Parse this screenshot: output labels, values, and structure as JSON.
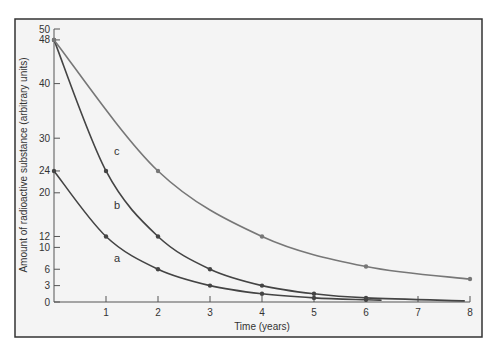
{
  "chart_data": {
    "type": "line",
    "title": "",
    "xlabel": "Time (years)",
    "ylabel": "Amount of radioactive substance (arbitrary units)",
    "xlim": [
      0,
      8
    ],
    "ylim": [
      0,
      50
    ],
    "x_ticks": [
      "1",
      "2",
      "3",
      "4",
      "5",
      "6",
      "7",
      "8"
    ],
    "y_ticks": [
      "0",
      "3",
      "6",
      "10",
      "12",
      "20",
      "24",
      "30",
      "40",
      "48",
      "50"
    ],
    "grid": false,
    "legend": "inline curve labels",
    "series": [
      {
        "name": "a",
        "label_pos": [
          2.0,
          8.5
        ],
        "x": [
          0,
          1,
          2,
          3,
          4,
          5,
          6
        ],
        "values": [
          24,
          12,
          6,
          3,
          1.5,
          0.75,
          0.4
        ],
        "curve_end_x": 6.3,
        "color": "#444444"
      },
      {
        "name": "b",
        "label_pos": [
          2.0,
          18.5
        ],
        "x": [
          0,
          1,
          2,
          3,
          4,
          5,
          6
        ],
        "values": [
          48,
          24,
          12,
          6,
          3,
          1.5,
          0.75
        ],
        "curve_end_x": 7.9,
        "color": "#444444"
      },
      {
        "name": "c",
        "label_pos": [
          1.8,
          27
        ],
        "x": [
          0,
          2,
          4,
          6,
          8
        ],
        "values": [
          48,
          24,
          12,
          6.5,
          4.2
        ],
        "curve_end_x": 8,
        "color": "#777777"
      }
    ]
  },
  "labels": {
    "curve_a": "a",
    "curve_b": "b",
    "curve_c": "c"
  }
}
